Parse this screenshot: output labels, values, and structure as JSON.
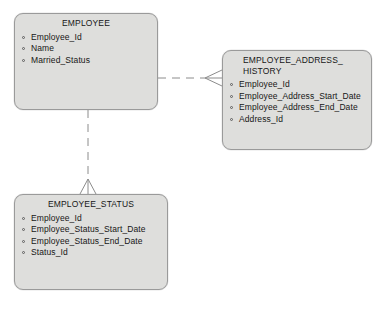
{
  "diagram": {
    "type": "entity-relationship-diagram",
    "background_color": "#ffffff",
    "entity_fill_color": "#dededc",
    "entity_border_color": "#9a9a9a",
    "connector_color": "#8c8c8c",
    "text_color": "#161616"
  },
  "entities": [
    {
      "id": "employee",
      "title": "EMPLOYEE",
      "title_lines": [
        "EMPLOYEE"
      ],
      "attributes": [
        "Employee_Id",
        "Name",
        "Married_Status"
      ],
      "box": {
        "x": 14,
        "y": 13,
        "width": 144,
        "height": 97
      }
    },
    {
      "id": "employee-address-history",
      "title": "EMPLOYEE_ADDRESS_HISTORY",
      "title_lines": [
        "EMPLOYEE_ADDRESS_",
        "HISTORY"
      ],
      "attributes": [
        "Employee_Id",
        "Employee_Address_Start_Date",
        "Employee_Address_End_Date",
        "Address_Id"
      ],
      "box": {
        "x": 222,
        "y": 50,
        "width": 150,
        "height": 100
      }
    },
    {
      "id": "employee-status",
      "title": "EMPLOYEE_STATUS",
      "title_lines": [
        "EMPLOYEE_STATUS"
      ],
      "attributes": [
        "Employee_Id",
        "Employee_Status_Start_Date",
        "Employee_Status_End_Date",
        "Status_Id"
      ],
      "box": {
        "x": 14,
        "y": 194,
        "width": 154,
        "height": 96
      }
    }
  ],
  "relationships": [
    {
      "id": "employee-to-address-history",
      "from": "employee",
      "to": "employee-address-history",
      "line_style": "dashed",
      "target_marker": "crows-foot",
      "orientation": "horizontal"
    },
    {
      "id": "employee-to-status",
      "from": "employee",
      "to": "employee-status",
      "line_style": "dashed",
      "target_marker": "crows-foot",
      "orientation": "vertical"
    }
  ]
}
